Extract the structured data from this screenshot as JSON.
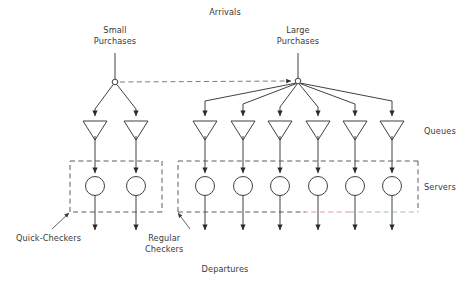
{
  "diagram": {
    "title_top": "Arrivals",
    "title_bottom": "Departures",
    "source_labels": [
      {
        "id": "small-purchases",
        "text": "Small\nPurchases",
        "x": 115,
        "y": 25
      },
      {
        "id": "large-purchases",
        "text": "Large\nPurchases",
        "x": 298,
        "y": 25
      }
    ],
    "row_labels": [
      {
        "id": "queues",
        "text": "Queues",
        "x": 424,
        "y": 126
      },
      {
        "id": "servers",
        "text": "Servers",
        "x": 424,
        "y": 182
      }
    ],
    "callout_labels": [
      {
        "id": "quick-checkers",
        "text": "Quick-Checkers",
        "x": 16,
        "y": 233
      },
      {
        "id": "regular-checkers",
        "text": "Regular\nCheckers",
        "x": 145,
        "y": 233
      }
    ],
    "arrivals": {
      "text": "Arrivals",
      "x": 225,
      "y": 7
    },
    "departures": {
      "text": "Departures",
      "x": 225,
      "y": 264
    },
    "colors": {
      "stroke": "#2b2b2b",
      "dashed_box": "#4a4a4a",
      "accent_red": "#d98f8f",
      "accent_teal": "#8fb5b0",
      "text": "#3a3a3a",
      "background": "#ffffff"
    },
    "geometry": {
      "split_small": {
        "x": 115,
        "y": 82,
        "r": 3
      },
      "split_large": {
        "x": 298,
        "y": 81,
        "r": 3
      },
      "source_stem_top": 53,
      "queue_triangle": {
        "top_y": 121,
        "bottom_y": 140,
        "half_width": 12
      },
      "server_circle": {
        "cy": 186,
        "r": 9.5
      },
      "departure_arrow_end": 233,
      "quick_box": {
        "x1": 70,
        "y1": 161,
        "x2": 162,
        "y2": 212
      },
      "regular_box": {
        "x1": 178,
        "y1": 161,
        "x2": 418,
        "y2": 212
      }
    },
    "lanes": {
      "quick": {
        "count": 2,
        "x": [
          95,
          136
        ]
      },
      "regular": {
        "count": 6,
        "x": [
          205,
          243,
          280,
          318,
          355,
          392
        ]
      }
    },
    "connector": {
      "from": "split_small",
      "to": "split_large",
      "style": "dashed",
      "arrowhead": true
    }
  }
}
